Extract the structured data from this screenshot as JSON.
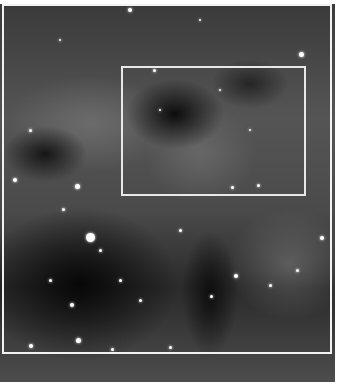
{
  "image": {
    "subject": "grayscale nebula star field",
    "palette": {
      "background": "#ffffff",
      "frame": "#f2f2f2",
      "sky_dark": "#0a0a0a",
      "nebula_gray": "#6e6e6e"
    }
  },
  "overlays": [
    {
      "name": "outer-frame",
      "x": 2,
      "y": 4,
      "width": 330,
      "height": 350
    },
    {
      "name": "inner-box",
      "x": 121,
      "y": 66,
      "width": 185,
      "height": 130
    }
  ],
  "stars": [
    [
      130,
      10,
      4
    ],
    [
      301,
      54,
      5
    ],
    [
      154,
      70,
      3
    ],
    [
      90,
      237,
      9
    ],
    [
      77,
      186,
      5
    ],
    [
      63,
      209,
      3
    ],
    [
      15,
      180,
      4
    ],
    [
      100,
      250,
      3
    ],
    [
      120,
      280,
      3
    ],
    [
      72,
      305,
      4
    ],
    [
      31,
      346,
      4
    ],
    [
      78,
      340,
      5
    ],
    [
      112,
      349,
      3
    ],
    [
      170,
      347,
      3
    ],
    [
      270,
      285,
      3
    ],
    [
      322,
      238,
      4
    ],
    [
      236,
      276,
      4
    ],
    [
      211,
      296,
      3
    ],
    [
      232,
      187,
      3
    ],
    [
      258,
      185,
      3
    ],
    [
      297,
      270,
      3
    ],
    [
      50,
      280,
      3
    ],
    [
      140,
      300,
      3
    ],
    [
      180,
      230,
      3
    ],
    [
      30,
      130,
      3
    ],
    [
      160,
      110,
      2
    ],
    [
      250,
      130,
      2
    ],
    [
      220,
      90,
      2
    ],
    [
      60,
      40,
      2
    ],
    [
      200,
      20,
      2
    ]
  ]
}
